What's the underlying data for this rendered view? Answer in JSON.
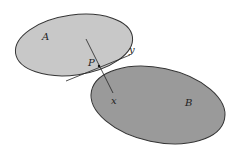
{
  "diagram": {
    "sets": [
      {
        "label": "A",
        "fill": "#c8c8c8",
        "stroke": "#333333"
      },
      {
        "label": "B",
        "fill": "#9a9a9a",
        "stroke": "#333333"
      }
    ],
    "points": {
      "P": "P",
      "x": "x",
      "y": "y"
    },
    "line_color": "#222222"
  }
}
